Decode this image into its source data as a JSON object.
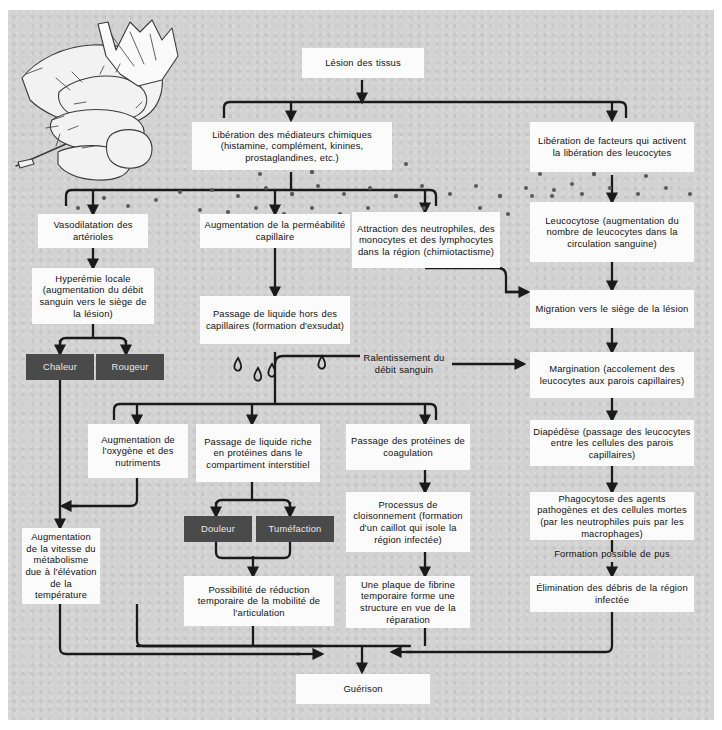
{
  "diagram": {
    "language": "fr",
    "colors": {
      "plate": "#d2d2d2",
      "box": "#fbfbfb",
      "dark_box": "#4a4a4a",
      "line": "#1a1a1a",
      "text": "#111111",
      "dark_box_text": "#e9e9e9"
    },
    "illustration": {
      "name": "hand-with-splinter-illustration",
      "description": "Dessin au trait d'une main recevant une écharde"
    }
  },
  "nodes": {
    "lesion": "Lésion des tissus",
    "mediateurs": "Libération des médiateurs chimiques (histamine, complément, kinines, prostaglandines, etc.)",
    "facteurs": "Libération de facteurs qui activent la libération des leucocytes",
    "vasodilatation": "Vasodilatation des artérioles",
    "permeabilite": "Augmentation de la perméabilité capillaire",
    "attraction": "Attraction des neutrophiles, des monocytes et des lymphocytes dans la région (chimiotactisme)",
    "leucocytose": "Leucocytose (augmentation du nombre de leucocytes dans la circulation sanguine)",
    "hyperemie": "Hyperémie locale (augmentation du débit sanguin vers le siège de la lésion)",
    "exsudat": "Passage de liquide hors des capillaires (formation d'exsudat)",
    "migration": "Migration vers le siège de la lésion",
    "chaleur": "Chaleur",
    "rougeur": "Rougeur",
    "ralentissement": "Ralentissement du débit sanguin",
    "margination": "Margination (accolement des leucocytes aux parois capillaires)",
    "oxygene": "Augmentation de l'oxygène et des nutriments",
    "liquide_riche": "Passage de liquide riche en protéines dans le compartiment interstitiel",
    "proteines": "Passage des protéines de coagulation",
    "diapedese": "Diapédèse (passage des leucocytes entre les cellules des parois capillaires)",
    "douleur": "Douleur",
    "tumefaction": "Tuméfaction",
    "cloisonnement": "Processus de cloisonnement (formation d'un caillot qui isole la région infectée)",
    "phagocytose": "Phagocytose des agents pathogènes et des cellules mortes (par les neutrophiles puis par les macrophages)",
    "metabolisme": "Augmentation de la vitesse du métabolisme due à l'élévation de la température",
    "pus": "Formation possible de pus",
    "mobilite": "Possibilité de réduction temporaire de la mobilité de l'articulation",
    "fibrine": "Une plaque de fibrine temporaire forme une structure en vue de la réparation",
    "elimination": "Élimination des débris de la région infectée",
    "guerison": "Guérison"
  }
}
